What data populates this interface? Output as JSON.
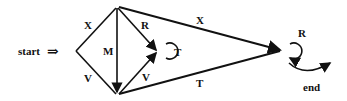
{
  "diagram": {
    "start_label": "start",
    "start_arrow": "⇒",
    "end_label": "end",
    "edges": {
      "top_left": "X",
      "bottom_left": "V",
      "middle": "M",
      "top_right": "R",
      "bottom_right": "V",
      "upper_long": "X",
      "lower_long": "T"
    },
    "loops": {
      "middle_loop": "T",
      "final_loop": "R"
    },
    "stroke_color": "#111111"
  }
}
